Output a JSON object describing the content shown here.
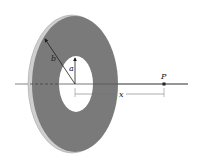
{
  "diagram": {
    "labels": {
      "outer_radius": "b",
      "inner_radius": "a",
      "distance": "x",
      "point": "P"
    },
    "colors": {
      "disk_face": "#7a7a7a",
      "disk_rim": "#c8c8c8",
      "hole": "#ffffff",
      "axis": "#555555",
      "arrow": "#1e1e1e",
      "point": "#222222"
    }
  }
}
